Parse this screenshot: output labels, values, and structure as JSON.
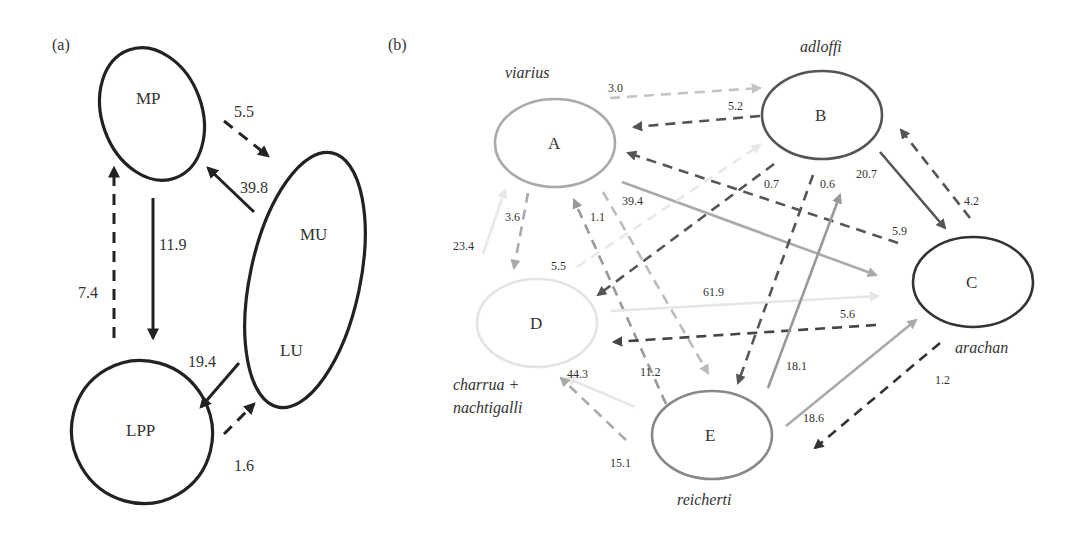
{
  "panel_a": {
    "label": "(a)",
    "nodes": [
      {
        "id": "MP",
        "label": "MP",
        "cx": 152,
        "cy": 114,
        "rx": 50,
        "ry": 68,
        "rot": -20
      },
      {
        "id": "MU_LU",
        "label_top": "MU",
        "label_bottom": "LU",
        "cx": 305,
        "cy": 280,
        "rx": 55,
        "ry": 130,
        "rot": 12
      },
      {
        "id": "LPP",
        "label": "LPP",
        "cx": 142,
        "cy": 432,
        "rx": 70,
        "ry": 72,
        "rot": -30
      }
    ],
    "edges": [
      {
        "label": "5.5",
        "x1": 224,
        "y1": 121,
        "x2": 268,
        "y2": 156,
        "dashed": true,
        "lx": 234,
        "ly": 117
      },
      {
        "label": "39.8",
        "x1": 254,
        "y1": 212,
        "x2": 208,
        "y2": 168,
        "dashed": false,
        "lx": 240,
        "ly": 193
      },
      {
        "label": "11.9",
        "x1": 153,
        "y1": 198,
        "x2": 153,
        "y2": 338,
        "dashed": false,
        "lx": 159,
        "ly": 250
      },
      {
        "label": "7.4",
        "x1": 114,
        "y1": 338,
        "x2": 114,
        "y2": 168,
        "dashed": true,
        "lx": 78,
        "ly": 298
      },
      {
        "label": "19.4",
        "x1": 239,
        "y1": 363,
        "x2": 201,
        "y2": 407,
        "dashed": false,
        "lx": 188,
        "ly": 367
      },
      {
        "label": "1.6",
        "x1": 224,
        "y1": 434,
        "x2": 254,
        "y2": 404,
        "dashed": true,
        "lx": 234,
        "ly": 471
      }
    ]
  },
  "panel_b": {
    "label": "(b)",
    "nodes": [
      {
        "id": "A",
        "label": "A",
        "species": "viarius",
        "cx": 555,
        "cy": 143,
        "rx": 60,
        "ry": 44,
        "stroke": "#aaaaaa",
        "sx": 505,
        "sy": 78
      },
      {
        "id": "B",
        "label": "B",
        "species": "adloffi",
        "cx": 822,
        "cy": 115,
        "rx": 60,
        "ry": 44,
        "stroke": "#555555",
        "sx": 800,
        "sy": 52
      },
      {
        "id": "C",
        "label": "C",
        "species": "arachan",
        "cx": 973,
        "cy": 282,
        "rx": 60,
        "ry": 45,
        "stroke": "#333333",
        "sx": 955,
        "sy": 353
      },
      {
        "id": "D",
        "label": "D",
        "species": "charrua +",
        "species2": "nachtigalli",
        "cx": 537,
        "cy": 323,
        "rx": 60,
        "ry": 44,
        "stroke": "#e4e4e4",
        "sx": 453,
        "sy": 390,
        "sx2": 453,
        "sy2": 413
      },
      {
        "id": "E",
        "label": "E",
        "species": "reicherti",
        "cx": 712,
        "cy": 435,
        "rx": 60,
        "ry": 44,
        "stroke": "#888888",
        "sx": 677,
        "sy": 505
      }
    ],
    "edges": [
      {
        "label": "3.0",
        "x1": 610,
        "y1": 98,
        "x2": 760,
        "y2": 88,
        "dashed": true,
        "color": "#c4c4c4",
        "lx": 608,
        "ly": 92
      },
      {
        "label": "5.2",
        "x1": 760,
        "y1": 116,
        "x2": 634,
        "y2": 127,
        "dashed": true,
        "color": "#555555",
        "lx": 728,
        "ly": 110
      },
      {
        "label": "5.9",
        "x1": 898,
        "y1": 243,
        "x2": 628,
        "y2": 153,
        "dashed": true,
        "color": "#555555",
        "lx": 892,
        "ly": 235
      },
      {
        "label": "39.4",
        "x1": 622,
        "y1": 182,
        "x2": 876,
        "y2": 275,
        "dashed": false,
        "color": "#aaaaaa",
        "lx": 622,
        "ly": 205
      },
      {
        "label": "0.7",
        "x1": 774,
        "y1": 164,
        "x2": 598,
        "y2": 295,
        "dashed": true,
        "color": "#555555",
        "lx": 764,
        "ly": 188
      },
      {
        "label": "0.6",
        "x1": 813,
        "y1": 175,
        "x2": 738,
        "y2": 383,
        "dashed": true,
        "color": "#555555",
        "lx": 820,
        "ly": 188
      },
      {
        "label": "20.7",
        "x1": 880,
        "y1": 152,
        "x2": 945,
        "y2": 228,
        "dashed": false,
        "color": "#555555",
        "lx": 856,
        "ly": 178
      },
      {
        "label": "4.2",
        "x1": 970,
        "y1": 218,
        "x2": 901,
        "y2": 130,
        "dashed": true,
        "color": "#555555",
        "lx": 964,
        "ly": 205
      },
      {
        "label": "3.6",
        "x1": 528,
        "y1": 193,
        "x2": 514,
        "y2": 268,
        "dashed": true,
        "color": "#aaaaaa",
        "lx": 505,
        "ly": 221
      },
      {
        "label": "23.4",
        "x1": 483,
        "y1": 254,
        "x2": 505,
        "y2": 190,
        "dashed": false,
        "color": "#e8e8e8",
        "lx": 453,
        "ly": 250
      },
      {
        "label": "5.5",
        "x1": 577,
        "y1": 267,
        "x2": 760,
        "y2": 145,
        "dashed": true,
        "color": "#e8e8e8",
        "lx": 551,
        "ly": 270
      },
      {
        "label": "1.1",
        "x1": 666,
        "y1": 404,
        "x2": 574,
        "y2": 200,
        "dashed": true,
        "color": "#999999",
        "lx": 590,
        "ly": 221
      },
      {
        "label": "11.2",
        "x1": 603,
        "y1": 192,
        "x2": 708,
        "y2": 373,
        "dashed": true,
        "color": "#bbbbbb",
        "lx": 640,
        "ly": 376
      },
      {
        "label": "61.9",
        "x1": 611,
        "y1": 311,
        "x2": 878,
        "y2": 296,
        "dashed": false,
        "color": "#e6e6e6",
        "lx": 703,
        "ly": 296
      },
      {
        "label": "5.6",
        "x1": 876,
        "y1": 325,
        "x2": 614,
        "y2": 342,
        "dashed": true,
        "color": "#444444",
        "lx": 840,
        "ly": 318
      },
      {
        "label": "18.1",
        "x1": 768,
        "y1": 388,
        "x2": 840,
        "y2": 195,
        "dashed": false,
        "color": "#999999",
        "lx": 786,
        "ly": 370
      },
      {
        "label": "18.6",
        "x1": 786,
        "y1": 426,
        "x2": 916,
        "y2": 320,
        "dashed": false,
        "color": "#aaaaaa",
        "lx": 803,
        "ly": 422
      },
      {
        "label": "1.2",
        "x1": 940,
        "y1": 343,
        "x2": 815,
        "y2": 448,
        "dashed": true,
        "color": "#333333",
        "lx": 935,
        "ly": 384
      },
      {
        "label": "44.3",
        "x1": 635,
        "y1": 407,
        "x2": 567,
        "y2": 378,
        "dashed": false,
        "color": "#e8e8e8",
        "lx": 567,
        "ly": 378
      },
      {
        "label": "15.1",
        "x1": 626,
        "y1": 440,
        "x2": 561,
        "y2": 378,
        "dashed": true,
        "color": "#aaaaaa",
        "lx": 610,
        "ly": 467
      }
    ]
  }
}
